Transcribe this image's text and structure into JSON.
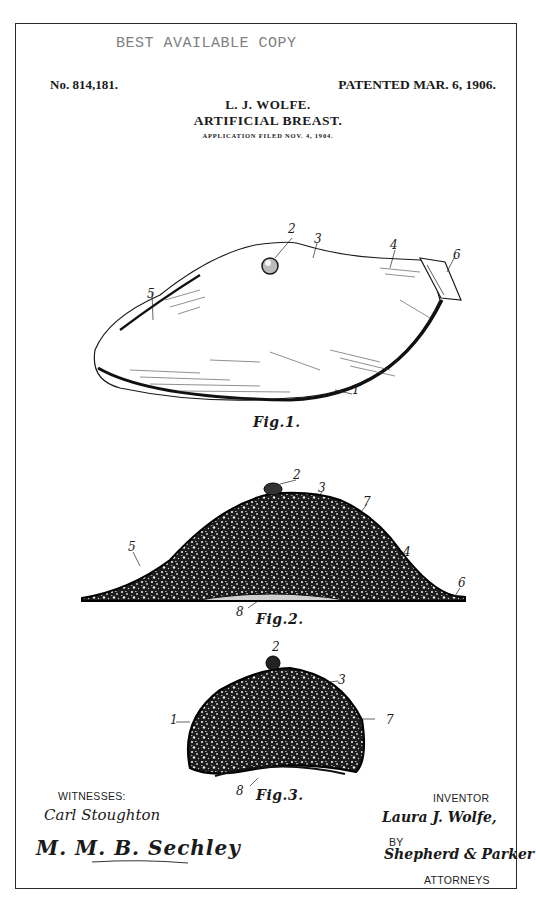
{
  "stamp": "BEST AVAILABLE COPY",
  "header": {
    "patent_number": "No. 814,181.",
    "patent_date": "PATENTED MAR. 6, 1906.",
    "inventor_name": "L. J. WOLFE.",
    "title": "ARTIFICIAL BREAST.",
    "application_filed": "APPLICATION FILED NOV. 4, 1904."
  },
  "figures": [
    {
      "label": "Fig.1.",
      "refs": [
        "2",
        "3",
        "4",
        "5",
        "6",
        "1"
      ]
    },
    {
      "label": "Fig.2.",
      "refs": [
        "2",
        "3",
        "7",
        "5",
        "4",
        "6",
        "8"
      ]
    },
    {
      "label": "Fig.3.",
      "refs": [
        "2",
        "3",
        "1",
        "7",
        "8"
      ]
    }
  ],
  "footer": {
    "witnesses_label": "WITNESSES:",
    "witness_1": "Carl Stoughton",
    "witness_2": "M. M. B. Sechley",
    "inventor_label": "INVENTOR",
    "inventor_signature": "Laura J. Wolfe,",
    "by_label": "BY",
    "attorney_signature": "Shepherd & Parker",
    "attorneys_label": "ATTORNEYS"
  }
}
